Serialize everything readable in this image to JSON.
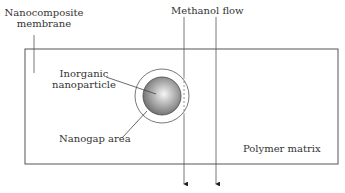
{
  "labels": {
    "membrane_line1": "Nanocomposite",
    "membrane_line2": "membrane",
    "flow": "Methanol flow",
    "particle_line1": "Inorganic",
    "particle_line2": "nanoparticle",
    "nanogap": "Nanogap area",
    "matrix": "Polymer matrix"
  },
  "colors": {
    "stroke": "#555555",
    "particle_light": "#f4f4f4",
    "particle_dark": "#6e6e6e",
    "text": "#333333"
  }
}
